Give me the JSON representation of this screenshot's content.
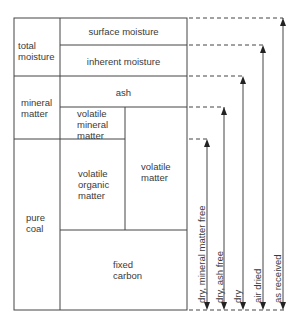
{
  "diagram": {
    "left_column": {
      "total_moisture": "total\nmoisture",
      "mineral_matter": "mineral\nmatter",
      "pure_coal": "pure\ncoal"
    },
    "middle_boxes": {
      "surface_moisture": "surface moisture",
      "inherent_moisture": "inherent moisture",
      "ash": "ash",
      "volatile_mineral_matter": "volatile\nmineral\nmatter",
      "volatile_organic_matter": "volatile\norganic\nmatter",
      "volatile_matter": "volatile\nmatter",
      "fixed_carbon": "fixed\ncarbon"
    },
    "bases": [
      {
        "label": "dry, mineral matter free"
      },
      {
        "label": "dry, ash free"
      },
      {
        "label": "dry"
      },
      {
        "label": "air dried"
      },
      {
        "label": "as received"
      }
    ],
    "colors": {
      "line": "#444444",
      "text": "#3a3a3a"
    }
  }
}
